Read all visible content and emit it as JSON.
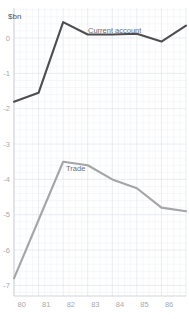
{
  "chart_data": {
    "type": "line",
    "title": "",
    "subtitle": "",
    "xlabel": "",
    "ylabel": "$bn",
    "unit_label": "$bn",
    "grid": true,
    "legend_position": "inline-annotation",
    "x": [
      "80",
      "81",
      "82",
      "83",
      "84",
      "85",
      "86",
      "87"
    ],
    "categories": [
      "80",
      "81",
      "82",
      "83",
      "84",
      "85",
      "86",
      "87"
    ],
    "xtick_labels": [
      "80",
      "81",
      "82",
      "83",
      "84",
      "85",
      "86",
      "87"
    ],
    "ytick_labels": [
      "0",
      "-1",
      "-2",
      "-3",
      "-4",
      "-5",
      "-6",
      "-7"
    ],
    "ytick_values": [
      0,
      -1,
      -2,
      -3,
      -4,
      -5,
      -6,
      -7
    ],
    "xlim": [
      "80",
      "87"
    ],
    "ylim": [
      -7.3,
      0.85
    ],
    "series": [
      {
        "name": "Current account",
        "label": "Current account",
        "color": "#4d4d52",
        "stroke_width": 2.1,
        "values": [
          -1.8,
          -1.55,
          0.45,
          0.1,
          0.1,
          0.12,
          -0.1,
          0.35
        ]
      },
      {
        "name": "Trade",
        "label": "Trade",
        "color": "#a5a5a8",
        "stroke_width": 2.1,
        "values": [
          -6.8,
          -5.15,
          -3.5,
          -3.6,
          -4.0,
          -4.25,
          -4.8,
          -4.9
        ]
      }
    ],
    "annotations": [
      {
        "text": "Current account",
        "series": "Current account",
        "x_px": 88,
        "y_px": 33
      },
      {
        "text": "Trade",
        "series": "Trade",
        "x_px": 66,
        "y_px": 171
      }
    ],
    "colors": {
      "background": "#ffffff",
      "grid_minor": "#eef1f5",
      "grid_major": "#dfe4ea",
      "axis": "#c8ccd2",
      "tick_text": "#a9a9ad",
      "unit_text": "#58585c",
      "current_account": "#4d4d52",
      "trade": "#a5a5a8"
    }
  }
}
